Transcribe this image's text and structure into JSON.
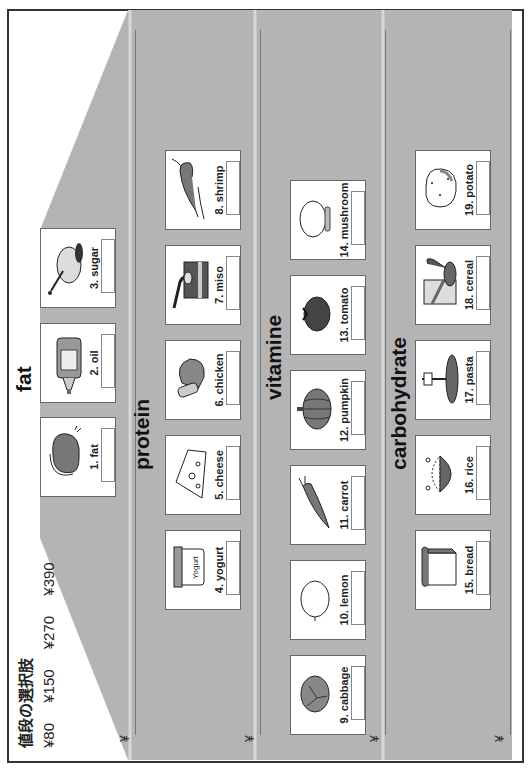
{
  "header": {
    "title": "値段の選択肢",
    "prices": [
      "¥80",
      "¥150",
      "¥270",
      "¥390"
    ]
  },
  "answer_lines": [
    {
      "yen": "¥"
    },
    {
      "yen": "¥"
    },
    {
      "yen": "¥"
    },
    {
      "yen": "¥"
    }
  ],
  "categories": [
    {
      "title": "fat",
      "items": [
        {
          "label": "1. fat",
          "icon": "fat-meat-icon"
        },
        {
          "label": "2. oil",
          "icon": "oil-bottle-icon"
        },
        {
          "label": "3. sugar",
          "icon": "sugar-pot-icon"
        }
      ]
    },
    {
      "title": "protein",
      "items": [
        {
          "label": "4. yogurt",
          "icon": "yogurt-icon"
        },
        {
          "label": "5. cheese",
          "icon": "cheese-icon"
        },
        {
          "label": "6. chicken",
          "icon": "chicken-leg-icon"
        },
        {
          "label": "7. miso",
          "icon": "miso-icon"
        },
        {
          "label": "8. shrimp",
          "icon": "shrimp-icon"
        }
      ]
    },
    {
      "title": "vitamine",
      "items": [
        {
          "label": "9. cabbage",
          "icon": "cabbage-icon"
        },
        {
          "label": "10. lemon",
          "icon": "lemon-icon"
        },
        {
          "label": "11. carrot",
          "icon": "carrot-icon"
        },
        {
          "label": "12. pumpkin",
          "icon": "pumpkin-icon"
        },
        {
          "label": "13. tomato",
          "icon": "tomato-icon"
        },
        {
          "label": "14. mushroom",
          "icon": "mushroom-icon"
        }
      ]
    },
    {
      "title": "carbohydrate",
      "items": [
        {
          "label": "15. bread",
          "icon": "bread-icon"
        },
        {
          "label": "16. rice",
          "icon": "rice-bowl-icon"
        },
        {
          "label": "17. pasta",
          "icon": "pasta-icon"
        },
        {
          "label": "18. cereal",
          "icon": "cereal-icon"
        },
        {
          "label": "19. potato",
          "icon": "potato-icon"
        }
      ]
    }
  ],
  "colors": {
    "pyramid_gray": "#b4b4b4",
    "frame": "#333333",
    "icon_dark": "#555555",
    "icon_mid": "#888888"
  }
}
